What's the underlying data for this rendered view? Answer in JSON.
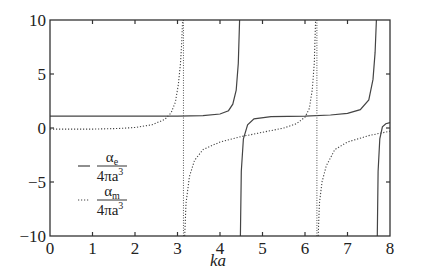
{
  "chart_data": {
    "type": "line",
    "title": "",
    "xlabel": "ka",
    "ylabel": "",
    "xlim": [
      0,
      8
    ],
    "ylim": [
      -10,
      10
    ],
    "xticks": [
      0,
      1,
      2,
      3,
      4,
      5,
      6,
      7,
      8
    ],
    "yticks": [
      10,
      5,
      0,
      -5,
      -10
    ],
    "grid": false,
    "legend_position": "left-middle",
    "series": [
      {
        "name": "alpha_e / 4πa³",
        "legend_num": "α",
        "legend_sub": "e",
        "legend_den": "4πa",
        "legend_sup": "3",
        "style": "solid",
        "segments": [
          [
            [
              0,
              1.1
            ],
            [
              1,
              1.1
            ],
            [
              2,
              1.1
            ],
            [
              3,
              1.1
            ],
            [
              3.6,
              1.15
            ],
            [
              4.0,
              1.3
            ],
            [
              4.2,
              1.6
            ],
            [
              4.3,
              2.2
            ],
            [
              4.38,
              3.5
            ],
            [
              4.43,
              6
            ],
            [
              4.46,
              10
            ]
          ],
          [
            [
              4.48,
              -10
            ],
            [
              4.5,
              -4
            ],
            [
              4.55,
              -1
            ],
            [
              4.65,
              0.3
            ],
            [
              4.8,
              0.85
            ],
            [
              5.2,
              1.05
            ],
            [
              6,
              1.1
            ],
            [
              6.6,
              1.2
            ],
            [
              7,
              1.35
            ],
            [
              7.3,
              1.7
            ],
            [
              7.5,
              2.6
            ],
            [
              7.6,
              4.5
            ],
            [
              7.65,
              7
            ],
            [
              7.68,
              10
            ]
          ],
          [
            [
              7.7,
              -10
            ],
            [
              7.72,
              -4
            ],
            [
              7.76,
              -1
            ],
            [
              7.82,
              0.1
            ],
            [
              7.9,
              0.4
            ],
            [
              8,
              0.5
            ]
          ]
        ]
      },
      {
        "name": "alpha_m / 4πa³",
        "legend_num": "α",
        "legend_sub": "m",
        "legend_den": "4πa",
        "legend_sup": "3",
        "style": "dotted",
        "segments": [
          [
            [
              0,
              -0.1
            ],
            [
              1,
              -0.1
            ],
            [
              1.6,
              -0.05
            ],
            [
              2.0,
              0.05
            ],
            [
              2.4,
              0.3
            ],
            [
              2.7,
              0.8
            ],
            [
              2.85,
              1.4
            ],
            [
              2.95,
              2.4
            ],
            [
              3.02,
              4
            ],
            [
              3.07,
              6
            ],
            [
              3.1,
              8
            ],
            [
              3.12,
              10
            ]
          ],
          [
            [
              3.17,
              -10
            ],
            [
              3.2,
              -7
            ],
            [
              3.28,
              -4.5
            ],
            [
              3.4,
              -3
            ],
            [
              3.6,
              -2
            ],
            [
              4,
              -1.3
            ],
            [
              4.5,
              -0.8
            ],
            [
              5,
              -0.4
            ],
            [
              5.5,
              0
            ],
            [
              5.8,
              0.4
            ],
            [
              6.0,
              1
            ],
            [
              6.1,
              1.8
            ],
            [
              6.17,
              3.5
            ],
            [
              6.22,
              6
            ],
            [
              6.25,
              10
            ]
          ],
          [
            [
              6.31,
              -10
            ],
            [
              6.34,
              -7
            ],
            [
              6.4,
              -5
            ],
            [
              6.5,
              -3.5
            ],
            [
              6.7,
              -2
            ],
            [
              7,
              -1.3
            ],
            [
              7.5,
              -0.7
            ],
            [
              8,
              -0.3
            ]
          ]
        ],
        "asymptotes": [
          3.14,
          6.28
        ]
      }
    ]
  }
}
